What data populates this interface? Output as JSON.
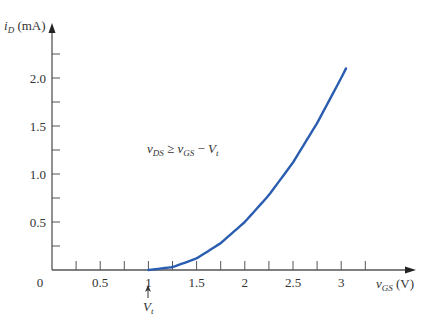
{
  "chart_data": {
    "type": "line",
    "title": "",
    "xlabel": "vGS (V)",
    "ylabel": "iD (mA)",
    "xlabel_parts": {
      "var": "v",
      "sub": "GS",
      "unit": "(V)"
    },
    "ylabel_parts": {
      "var": "i",
      "sub": "D",
      "unit": "(mA)"
    },
    "xlim": [
      0,
      3.4
    ],
    "ylim": [
      0,
      2.4
    ],
    "x_ticks_major": [
      0.5,
      1,
      1.5,
      2,
      2.5,
      3
    ],
    "x_tick_labels": [
      "0.5",
      "1",
      "1.5",
      "2",
      "2.5",
      "3"
    ],
    "x_ticks_minor": [
      0.25,
      0.5,
      0.75,
      1.0,
      1.25,
      1.5,
      1.75,
      2.0,
      2.25,
      2.5,
      2.75,
      3.0,
      3.25
    ],
    "y_ticks_major": [
      0.5,
      1.0,
      1.5,
      2.0
    ],
    "y_tick_labels": [
      "0.5",
      "1.0",
      "1.5",
      "2.0"
    ],
    "y_ticks_minor": [
      0.25,
      0.5,
      0.75,
      1.0,
      1.25,
      1.5,
      1.75,
      2.0,
      2.25
    ],
    "origin_label": "0",
    "grid": false,
    "legend": null,
    "series": [
      {
        "name": "iD vs vGS (saturation)",
        "color": "#2a5db0",
        "x": [
          1.0,
          1.25,
          1.5,
          1.75,
          2.0,
          2.25,
          2.5,
          2.75,
          3.0,
          3.05
        ],
        "y": [
          0.0,
          0.03,
          0.12,
          0.28,
          0.5,
          0.78,
          1.12,
          1.53,
          2.0,
          2.1
        ]
      }
    ],
    "annotations": [
      {
        "text": "vDS ≥ vGS − Vt",
        "x": 1.2,
        "y": 1.25
      },
      {
        "text": "Vt",
        "x": 1.0,
        "y": -0.3,
        "arrow_to": [
          1.0,
          -0.1
        ]
      }
    ]
  },
  "labels": {
    "y_axis": {
      "var": "i",
      "sub": "D",
      "unit": " (mA)"
    },
    "x_axis": {
      "var": "v",
      "sub": "GS",
      "unit": " (V)"
    },
    "origin": "0",
    "condition": {
      "lhs_var": "v",
      "lhs_sub": "DS",
      "op": " ≥ ",
      "rhs_var": "v",
      "rhs_sub": "GS",
      "minus": " − ",
      "vt_var": "V",
      "vt_sub": "t"
    },
    "vt_marker": {
      "var": "V",
      "sub": "t"
    }
  },
  "colors": {
    "axis": "#555555",
    "curve": "#2a5db0",
    "text": "#333333"
  }
}
